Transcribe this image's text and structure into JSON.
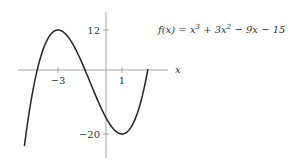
{
  "chart_data": {
    "type": "line",
    "title": "",
    "function_label": "f(x) = x³ + 3x² − 9x − 15",
    "xlabel": "x",
    "ylabel": "",
    "x_ticks": [
      {
        "value": -3,
        "label": "−3"
      },
      {
        "value": 1,
        "label": "1"
      }
    ],
    "y_ticks": [
      {
        "value": 12,
        "label": "12"
      },
      {
        "value": -20,
        "label": "−20"
      }
    ],
    "xlim": [
      -5.6,
      3.6
    ],
    "ylim": [
      -29,
      17
    ],
    "grid": false,
    "series": [
      {
        "name": "f(x) = x^3 + 3x^2 - 9x - 15",
        "x": [
          -5.1,
          -5,
          -4,
          -3,
          -2,
          -1,
          0,
          1,
          2,
          2.6
        ],
        "values": [
          -22.0,
          -20,
          5,
          12,
          7,
          -4,
          -15,
          -20,
          -13,
          0.4
        ]
      }
    ],
    "annotations": {
      "local_max": {
        "x": -3,
        "y": 12
      },
      "local_min": {
        "x": 1,
        "y": -20
      }
    }
  }
}
